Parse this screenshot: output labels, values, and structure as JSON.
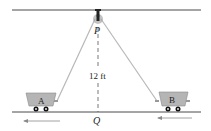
{
  "diagram": {
    "pulley_label": "P",
    "ground_point_label": "Q",
    "height_label": "12 ft",
    "cart_a_label": "A",
    "cart_b_label": "B",
    "colors": {
      "line": "#4a4a4a",
      "rope": "#b8b8b8",
      "cart_fill": "#b5b5b5",
      "cart_stroke": "#8a8a8a",
      "wheel": "#111111",
      "pulley": "#9a9a9a",
      "arrow": "#8a8a8a"
    }
  }
}
